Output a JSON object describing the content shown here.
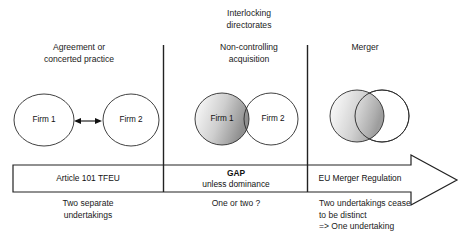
{
  "diagram": {
    "title_note": "EU competition law spectrum: agreement, non-controlling acquisition, merger",
    "columns": [
      {
        "id": "agreement",
        "heading": "Agreement or\nconcerted practice",
        "superheading": "",
        "shapes": [
          {
            "label": "Firm 1",
            "fill": "white"
          },
          {
            "label": "Firm 2",
            "fill": "white"
          }
        ],
        "connector": "double-headed-arrow",
        "banner_main": "Article 101 TFEU",
        "banner_main_bold": false,
        "banner_sub": "",
        "footer": "Two separate\nundertakings"
      },
      {
        "id": "non-controlling-acquisition",
        "superheading": "Interlocking\ndirectorates",
        "heading": "Non-controlling\nacquisition",
        "shapes": [
          {
            "label": "Firm 1",
            "fill": "gradient"
          },
          {
            "label": "Firm 2",
            "fill": "white"
          }
        ],
        "connector": "slight-overlap",
        "banner_main": "GAP",
        "banner_main_bold": true,
        "banner_sub": "unless dominance",
        "footer": "One or two ?"
      },
      {
        "id": "merger",
        "superheading": "",
        "heading": "Merger",
        "shapes": [
          {
            "label": "",
            "fill": "gradient"
          },
          {
            "label": "",
            "fill": "white"
          }
        ],
        "connector": "large-overlap",
        "banner_main": "EU Merger Regulation",
        "banner_main_bold": false,
        "banner_sub": "",
        "footer": "Two undertakings cease\nto be distinct\n=> One undertaking"
      }
    ],
    "colors": {
      "stroke": "#222222",
      "text": "#1a1a1a",
      "background": "#ffffff",
      "shade_light": "#f2f2f2",
      "shade_dark": "#9a9a9a"
    }
  }
}
